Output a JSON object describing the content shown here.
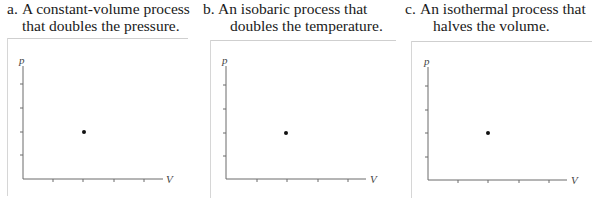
{
  "panels": [
    {
      "letter": "a.",
      "title_line1": "A constant-volume process",
      "title_line2": "that doubles the pressure.",
      "y_axis_label": "p",
      "x_axis_label": "V",
      "initial_state": {
        "v_tick": 2,
        "p_tick": 2
      }
    },
    {
      "letter": "b.",
      "title_line1": "An isobaric process that",
      "title_line2": "doubles the temperature.",
      "y_axis_label": "p",
      "x_axis_label": "V",
      "initial_state": {
        "v_tick": 2,
        "p_tick": 2
      }
    },
    {
      "letter": "c.",
      "title_line1": "An isothermal process that",
      "title_line2": "halves the volume.",
      "y_axis_label": "p",
      "x_axis_label": "V",
      "initial_state": {
        "v_tick": 2,
        "p_tick": 2
      }
    }
  ],
  "grid": {
    "x_ticks": 4,
    "y_ticks": 4
  },
  "colors": {
    "frame": "#cfcfcf",
    "axis": "#6a6a6a",
    "dot": "#111111"
  }
}
